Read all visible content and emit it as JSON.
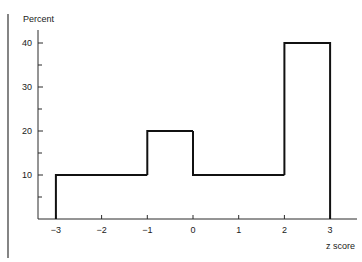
{
  "chart_data": {
    "type": "bar",
    "subtype": "histogram",
    "title": "",
    "xlabel": "z score",
    "ylabel": "Percent",
    "bins": [
      {
        "from": -3,
        "to": -1,
        "value": 10
      },
      {
        "from": -1,
        "to": 0,
        "value": 20
      },
      {
        "from": 0,
        "to": 2,
        "value": 10
      },
      {
        "from": 2,
        "to": 3,
        "value": 40
      }
    ],
    "xlim": [
      -3.4,
      3.6
    ],
    "ylim": [
      0,
      43
    ],
    "x_ticks": [
      -3,
      -2,
      -1,
      0,
      1,
      2,
      3
    ],
    "x_tick_labels": [
      "−3",
      "−2",
      "−1",
      "0",
      "1",
      "2",
      "3"
    ],
    "y_ticks": [
      10,
      20,
      30,
      40
    ],
    "y_tick_labels": [
      "10",
      "20",
      "30",
      "40"
    ],
    "y_minor_ticks": [
      5,
      15,
      25,
      35
    ],
    "grid": false,
    "legend": "none"
  }
}
